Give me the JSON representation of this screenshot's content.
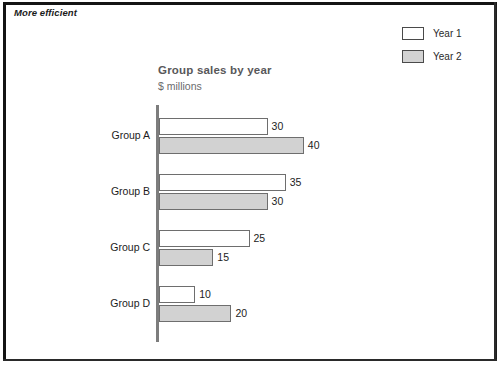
{
  "banner": {
    "label": "More efficient"
  },
  "chart": {
    "title": "Group sales by year",
    "subtitle": "$ millions"
  },
  "legend": {
    "items": [
      {
        "label": "Year 1",
        "color": "#ffffff"
      },
      {
        "label": "Year 2",
        "color": "#d2d2d2"
      }
    ]
  },
  "colors": {
    "series_1": "#ffffff",
    "series_2": "#d2d2d2",
    "bar_outline": "#6e6e6e",
    "axis": "#7d7d7d",
    "title": "#58585a",
    "frame": "#141414"
  },
  "chart_data": {
    "type": "bar",
    "orientation": "horizontal",
    "title": "Group sales by year",
    "subtitle": "$ millions",
    "xlabel": "",
    "ylabel": "",
    "categories": [
      "Group A",
      "Group B",
      "Group C",
      "Group D"
    ],
    "series": [
      {
        "name": "Year 1",
        "values": [
          30,
          35,
          25,
          10
        ]
      },
      {
        "name": "Year 2",
        "values": [
          40,
          30,
          15,
          20
        ]
      }
    ],
    "xlim": [
      0,
      40
    ],
    "grid": false,
    "legend_position": "top-right",
    "data_labels": true,
    "data_label_values": [
      [
        "30",
        "40"
      ],
      [
        "35",
        "30"
      ],
      [
        "25",
        "15"
      ],
      [
        "10",
        "20"
      ]
    ]
  }
}
